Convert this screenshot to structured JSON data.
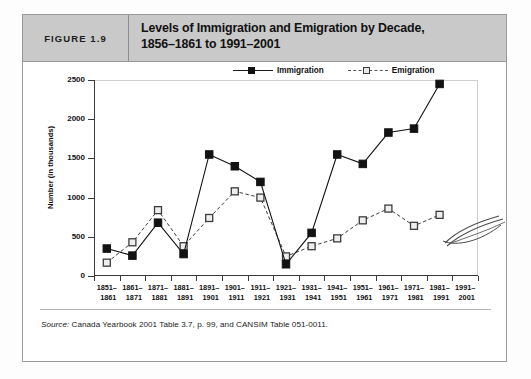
{
  "figure": {
    "number_label": "FIGURE 1.9",
    "title_line1": "Levels of Immigration and Emigration by Decade,",
    "title_line2": "1856–1861 to 1991–2001",
    "source_prefix": "Source:",
    "source_text": " Canada Yearbook 2001 Table 3.7, p. 99, and CANSIM Table 051-0011."
  },
  "colors": {
    "header_band": "#c9c9c9",
    "frame": "#9a9a9a",
    "immigration": "#121212",
    "emigration": "#3c3c3c",
    "axis": "#3a3a3a"
  },
  "legend": {
    "position": "top-right",
    "items": [
      {
        "label": "Immigration",
        "marker": "filled-square",
        "line": "solid"
      },
      {
        "label": "Emigration",
        "marker": "open-square",
        "line": "dashed"
      }
    ]
  },
  "chart_data": {
    "type": "line",
    "title": "Levels of Immigration and Emigration by Decade, 1856–1861 to 1991–2001",
    "xlabel": "",
    "ylabel": "Number (in thousands)",
    "ylim": [
      0,
      2500
    ],
    "yticks": [
      0,
      500,
      1000,
      1500,
      2000,
      2500
    ],
    "grid": false,
    "legend_position": "top-right",
    "categories": [
      "1851–1861",
      "1861–1871",
      "1871–1881",
      "1881–1891",
      "1891–1901",
      "1901–1911",
      "1911–1921",
      "1921–1931",
      "1931–1941",
      "1941–1951",
      "1951–1961",
      "1961–1971",
      "1971–1981",
      "1981–1991",
      "1991–2001"
    ],
    "categories_split": [
      [
        "1851–",
        "1861"
      ],
      [
        "1861–",
        "1871"
      ],
      [
        "1871–",
        "1881"
      ],
      [
        "1881–",
        "1891"
      ],
      [
        "1891–",
        "1901"
      ],
      [
        "1901–",
        "1911"
      ],
      [
        "1911–",
        "1921"
      ],
      [
        "1921–",
        "1931"
      ],
      [
        "1931–",
        "1941"
      ],
      [
        "1941–",
        "1951"
      ],
      [
        "1951–",
        "1961"
      ],
      [
        "1961–",
        "1971"
      ],
      [
        "1971–",
        "1981"
      ],
      [
        "1981–",
        "1991"
      ],
      [
        "1991–",
        "2001"
      ]
    ],
    "series": [
      {
        "name": "Immigration",
        "marker": "filled-square",
        "line": "solid",
        "values": [
          350,
          260,
          680,
          280,
          1550,
          1400,
          1200,
          150,
          550,
          1550,
          1430,
          1830,
          1880,
          2450,
          null
        ]
      },
      {
        "name": "Emigration",
        "marker": "open-square",
        "line": "dashed",
        "values": [
          170,
          430,
          840,
          380,
          740,
          1080,
          1000,
          250,
          380,
          480,
          710,
          860,
          640,
          780,
          null
        ]
      }
    ]
  },
  "annotations": {
    "scribble": "handwritten-pen-stroke-artifact"
  }
}
